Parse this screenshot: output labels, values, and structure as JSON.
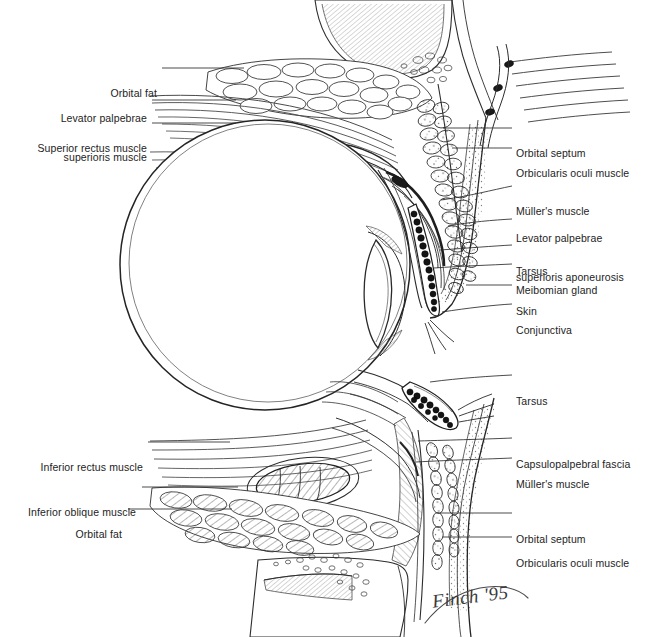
{
  "figure": {
    "signature": "Finch '95",
    "background_color": "#ffffff",
    "ink_color": "#232323"
  },
  "labels_left": [
    {
      "id": "orbital-fat-superior",
      "text": "Orbital fat",
      "lines": [
        "Orbital fat"
      ]
    },
    {
      "id": "levator-palpebrae-superioris-muscle",
      "text": "Levator palpebrae superioris muscle",
      "lines": [
        "Levator palpebrae",
        "superioris muscle"
      ]
    },
    {
      "id": "superior-rectus-muscle",
      "text": "Superior rectus muscle",
      "lines": [
        "Superior rectus muscle"
      ]
    },
    {
      "id": "inferior-rectus-muscle",
      "text": "Inferior rectus muscle",
      "lines": [
        "Inferior rectus muscle"
      ]
    },
    {
      "id": "inferior-oblique-muscle",
      "text": "Inferior oblique muscle",
      "lines": [
        "Inferior oblique muscle"
      ]
    },
    {
      "id": "orbital-fat-inferior",
      "text": "Orbital fat",
      "lines": [
        "Orbital fat"
      ]
    }
  ],
  "labels_right": [
    {
      "id": "orbital-septum-superior",
      "text": "Orbital septum",
      "lines": [
        "Orbital septum"
      ]
    },
    {
      "id": "orbicularis-oculi-muscle-superior",
      "text": "Orbicularis oculi muscle",
      "lines": [
        "Orbicularis oculi muscle"
      ]
    },
    {
      "id": "mullers-muscle-superior",
      "text": "Müller's muscle",
      "lines": [
        "Müller's muscle"
      ]
    },
    {
      "id": "levator-palpebrae-superioris-aponeurosis",
      "text": "Levator palpebrae superioris aponeurosis",
      "lines": [
        "Levator palpebrae",
        "superioris aponeurosis"
      ]
    },
    {
      "id": "tarsus-superior",
      "text": "Tarsus",
      "lines": [
        "Tarsus"
      ]
    },
    {
      "id": "meibomian-gland",
      "text": "Meibomian gland",
      "lines": [
        "Meibomian gland"
      ]
    },
    {
      "id": "skin",
      "text": "Skin",
      "lines": [
        "Skin"
      ]
    },
    {
      "id": "conjunctiva",
      "text": "Conjunctiva",
      "lines": [
        "Conjunctiva"
      ]
    },
    {
      "id": "tarsus-inferior",
      "text": "Tarsus",
      "lines": [
        "Tarsus"
      ]
    },
    {
      "id": "capsulopalpebral-fascia",
      "text": "Capsulopalpebral fascia",
      "lines": [
        "Capsulopalpebral fascia"
      ]
    },
    {
      "id": "mullers-muscle-inferior",
      "text": "Müller's muscle",
      "lines": [
        "Müller's muscle"
      ]
    },
    {
      "id": "orbital-septum-inferior",
      "text": "Orbital septum",
      "lines": [
        "Orbital septum"
      ]
    },
    {
      "id": "orbicularis-oculi-muscle-inferior",
      "text": "Orbicularis oculi muscle",
      "lines": [
        "Orbicularis oculi muscle"
      ]
    }
  ],
  "structures": [
    {
      "id": "globe",
      "name": "eyeball globe"
    },
    {
      "id": "cornea-lens",
      "name": "cornea and lens"
    },
    {
      "id": "superior-orbital-bone",
      "name": "superior orbital rim bone"
    },
    {
      "id": "inferior-orbital-bone",
      "name": "inferior orbital rim bone"
    },
    {
      "id": "eyebrow-hairs",
      "name": "eyebrow hairs"
    },
    {
      "id": "eyelashes",
      "name": "eyelashes"
    }
  ]
}
